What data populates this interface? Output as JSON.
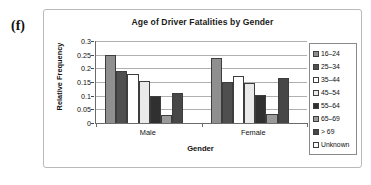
{
  "panel": {
    "label": "(f)"
  },
  "chart_data": {
    "type": "bar",
    "title": "Age of Driver Fatalities by Gender",
    "xlabel": "Gender",
    "ylabel": "Relative Frequency",
    "categories": [
      "Male",
      "Female"
    ],
    "ylim": [
      0,
      0.3
    ],
    "ytick_labels": [
      "0.3",
      "0.25",
      "0.2",
      "0.15",
      "0.1",
      "0.05",
      "0"
    ],
    "ytick_values": [
      0.3,
      0.25,
      0.2,
      0.15,
      0.1,
      0.05,
      0
    ],
    "grid": "horizontal",
    "legend_position": "right",
    "series": [
      {
        "name": "16–24",
        "color": "#8f8f8f",
        "values": [
          0.249,
          0.239
        ]
      },
      {
        "name": "25–34",
        "color": "#4f4f4f",
        "values": [
          0.189,
          0.151
        ]
      },
      {
        "name": "35–44",
        "color": "#ffffff",
        "values": [
          0.178,
          0.171
        ]
      },
      {
        "name": "45–54",
        "color": "#eaeaea",
        "values": [
          0.154,
          0.147
        ]
      },
      {
        "name": "55–64",
        "color": "#303030",
        "values": [
          0.1,
          0.104
        ]
      },
      {
        "name": "65–69",
        "color": "#9a9a9a",
        "values": [
          0.031,
          0.032
        ]
      },
      {
        "name": "> 69",
        "color": "#474747",
        "values": [
          0.11,
          0.165
        ]
      },
      {
        "name": "Unknown",
        "color": "#fbfbfb",
        "values": [
          0.0,
          0.0
        ]
      }
    ]
  }
}
